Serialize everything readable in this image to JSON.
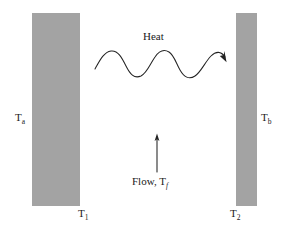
{
  "figure": {
    "background_color": "#ffffff",
    "plate_color": "#a3a3a3",
    "stroke_color": "#232323",
    "width": 285,
    "height": 230
  },
  "plates": {
    "left": {
      "name": "left-plate",
      "surface_temperature_label": "T",
      "surface_temperature_subscript": "a",
      "bulk_temperature_label": "T",
      "bulk_temperature_subscript": "1"
    },
    "right": {
      "name": "right-plate",
      "surface_temperature_label": "T",
      "surface_temperature_subscript": "b",
      "bulk_temperature_label": "T",
      "bulk_temperature_subscript": "2"
    }
  },
  "labels": {
    "t_a": "T",
    "t_a_sub": "a",
    "t_b": "T",
    "t_b_sub": "b",
    "t_1": "T",
    "t_1_sub": "1",
    "t_2": "T",
    "t_2_sub": "2",
    "heat": "Heat",
    "flow": "Flow, T",
    "flow_sub": "f"
  },
  "annotations": {
    "heat_arrow": {
      "name": "wavy-heat-arrow",
      "direction": "left-to-right",
      "style": "sinusoidal-wave-with-arrowhead"
    },
    "flow_arrow": {
      "name": "flow-arrow",
      "direction": "upward",
      "style": "straight-line-with-arrowhead"
    }
  }
}
